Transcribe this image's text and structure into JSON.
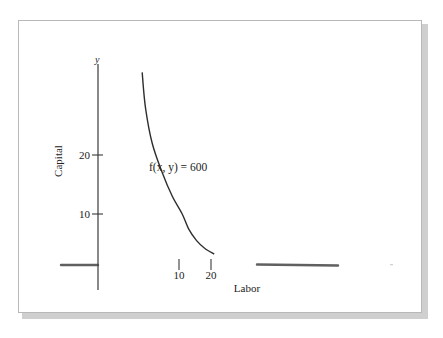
{
  "chart_data": {
    "type": "line",
    "title": "",
    "xlabel": "Labor",
    "ylabel": "Capital",
    "x_axis_var": "x",
    "y_axis_var": "y",
    "x_ticks": [
      10,
      20
    ],
    "x_tick_labels": [
      "10",
      "20"
    ],
    "y_ticks": [
      10,
      20
    ],
    "y_tick_labels": [
      "10",
      "20"
    ],
    "xlim": [
      0,
      30
    ],
    "ylim": [
      0,
      35
    ],
    "grid": false,
    "series": [
      {
        "name": "level-curve",
        "label": "f(x, y) = 600",
        "description": "Level curve of production function at output 600 (decreasing, convex)",
        "points": [
          {
            "x": 4.5,
            "y": 34
          },
          {
            "x": 5,
            "y": 28
          },
          {
            "x": 6,
            "y": 22
          },
          {
            "x": 7.5,
            "y": 17
          },
          {
            "x": 9,
            "y": 13
          },
          {
            "x": 11,
            "y": 10
          },
          {
            "x": 13,
            "y": 7.5
          },
          {
            "x": 15.5,
            "y": 5.5
          },
          {
            "x": 18,
            "y": 4.2
          },
          {
            "x": 21,
            "y": 3.2
          }
        ]
      }
    ],
    "annotations": [
      {
        "text": "f(x, y) = 600",
        "near": "curve middle-right"
      }
    ],
    "stray_mark": "\""
  }
}
